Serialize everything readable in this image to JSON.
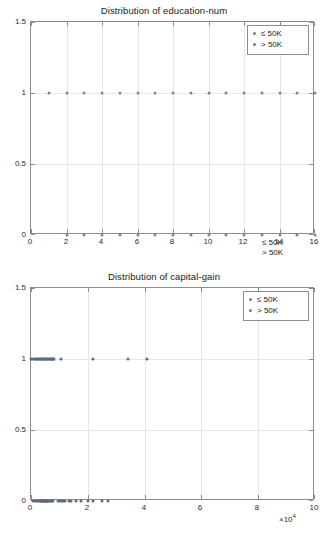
{
  "charts": [
    {
      "id": "education-num",
      "title": "Distribution of education-num",
      "legend": {
        "items": [
          "≤  50K",
          ">  50K"
        ],
        "position": "top-right"
      },
      "stray_legend_lines": [
        "≤  50K",
        ">  50K"
      ],
      "xlabel": "",
      "ylabel": "",
      "xlim": [
        0,
        16
      ],
      "ylim": [
        0,
        1.5
      ],
      "xticks": [
        "0",
        "2",
        "4",
        "6",
        "8",
        "10",
        "12",
        "14",
        "16"
      ],
      "xtick_values": [
        0,
        2,
        4,
        6,
        8,
        10,
        12,
        14,
        16
      ],
      "yticks": [
        "0",
        "0.5",
        "1",
        "1.5"
      ],
      "ytick_values": [
        0,
        0.5,
        1,
        1.5
      ],
      "grid": true
    },
    {
      "id": "capital-gain",
      "title": "Distribution of capital-gain",
      "legend": {
        "items": [
          "≤  50K",
          ">  50K"
        ],
        "position": "top-right"
      },
      "stray_legend_lines": [],
      "xlabel": "",
      "ylabel": "",
      "x_exponent": "×10",
      "x_exponent_power": "4",
      "xlim": [
        0,
        100000
      ],
      "ylim": [
        0,
        1.5
      ],
      "xticks": [
        "0",
        "2",
        "4",
        "6",
        "8",
        "10"
      ],
      "xtick_values": [
        0,
        20000,
        40000,
        60000,
        80000,
        100000
      ],
      "yticks": [
        "0",
        "0.5",
        "1",
        "1.5"
      ],
      "ytick_values": [
        0,
        0.5,
        1,
        1.5
      ],
      "grid": true
    }
  ],
  "chart_data": [
    {
      "type": "scatter",
      "title": "Distribution of education-num",
      "xlabel": "",
      "ylabel": "",
      "xlim": [
        0,
        16
      ],
      "ylim": [
        0,
        1.5
      ],
      "xticks": [
        0,
        2,
        4,
        6,
        8,
        10,
        12,
        14,
        16
      ],
      "yticks": [
        0,
        0.5,
        1,
        1.5
      ],
      "grid": true,
      "legend": [
        "≤  50K",
        ">  50K"
      ],
      "legend_position": "top-right",
      "series": [
        {
          "name": "≤  50K",
          "x": [
            1,
            2,
            3,
            4,
            5,
            6,
            7,
            8,
            9,
            10,
            11,
            12,
            13,
            14,
            15,
            16
          ],
          "y": [
            1,
            1,
            1,
            1,
            1,
            1,
            1,
            1,
            1,
            1,
            1,
            1,
            1,
            1,
            1,
            1
          ]
        },
        {
          "name": ">  50K",
          "x": [
            2,
            3,
            4,
            5,
            6,
            7,
            8,
            9,
            10,
            11,
            12,
            13,
            14,
            15,
            16
          ],
          "y": [
            0,
            0,
            0,
            0,
            0,
            0,
            0,
            0,
            0,
            0,
            0,
            0,
            0,
            0,
            0
          ]
        }
      ]
    },
    {
      "type": "scatter",
      "title": "Distribution of capital-gain",
      "xlabel": "×10^4",
      "ylabel": "",
      "xlim": [
        0,
        100000
      ],
      "ylim": [
        0,
        1.5
      ],
      "xticks": [
        0,
        20000,
        40000,
        60000,
        80000,
        100000
      ],
      "yticks": [
        0,
        0.5,
        1,
        1.5
      ],
      "grid": true,
      "legend": [
        "≤  50K",
        ">  50K"
      ],
      "legend_position": "top-right",
      "series": [
        {
          "name": "≤  50K",
          "x": [
            0,
            400,
            900,
            1400,
            1700,
            2000,
            2300,
            2600,
            3000,
            3300,
            3600,
            3900,
            4200,
            4500,
            4800,
            5100,
            5400,
            5700,
            6000,
            6300,
            6600,
            6900,
            7200,
            7500,
            7700,
            7900,
            8100,
            10500,
            22000,
            34000,
            41000
          ],
          "y": [
            1,
            1,
            1,
            1,
            1,
            1,
            1,
            1,
            1,
            1,
            1,
            1,
            1,
            1,
            1,
            1,
            1,
            1,
            1,
            1,
            1,
            1,
            1,
            1,
            1,
            1,
            1,
            1,
            1,
            1,
            1
          ]
        },
        {
          "name": ">  50K",
          "x": [
            600,
            1500,
            2200,
            2600,
            3000,
            3300,
            3600,
            3900,
            4200,
            4400,
            4600,
            4800,
            5000,
            5200,
            5400,
            5600,
            5800,
            6000,
            6300,
            6600,
            7000,
            7400,
            7800,
            9500,
            10200,
            10800,
            11400,
            12000,
            13500,
            14200,
            15800,
            17500,
            20000,
            22000,
            25000,
            27000
          ],
          "y": [
            0,
            0,
            0,
            0,
            0,
            0,
            0,
            0,
            0,
            0,
            0,
            0,
            0,
            0,
            0,
            0,
            0,
            0,
            0,
            0,
            0,
            0,
            0,
            0,
            0,
            0,
            0,
            0,
            0,
            0,
            0,
            0,
            0,
            0,
            0,
            0
          ]
        }
      ]
    }
  ],
  "colors": {
    "marker": "#6e7f93",
    "marker_dense": "#5b6b7e",
    "axis": "#8d8d8d",
    "grid": "#e6e6e6",
    "text": "#1a1a1a",
    "background": "#ffffff"
  }
}
